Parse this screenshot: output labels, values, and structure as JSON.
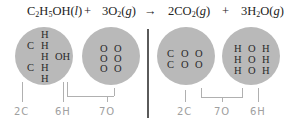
{
  "equation": {
    "reactant1": {
      "prefix": "C",
      "s1": "2",
      "mid": "H",
      "s2": "5",
      "suffix": "OH(",
      "state": "l",
      "close": ")"
    },
    "plus1": "+",
    "reactant2": {
      "coef": "3O",
      "s": "2",
      "open": "(",
      "state": "g",
      "close": ")"
    },
    "arrow": "→",
    "product1": {
      "coef": "2CO",
      "s": "2",
      "open": "(",
      "state": "g",
      "close": ")"
    },
    "plus2": "+",
    "product2": {
      "coef": "3H",
      "s": "2",
      "tail": "O(",
      "state": "g",
      "close": ")"
    }
  },
  "circles": {
    "ethanol": {
      "atoms": [
        "H",
        "C",
        "H",
        "H",
        "OH",
        "C",
        "H",
        "H"
      ]
    },
    "oxygen": {
      "atoms": [
        "O",
        "O",
        "O",
        "O",
        "O",
        "O"
      ]
    },
    "co2": {
      "atoms": [
        "C",
        "O",
        "O",
        "C",
        "O",
        "O"
      ]
    },
    "water": {
      "atoms": [
        "H",
        "O",
        "H",
        "H",
        "O",
        "H",
        "H",
        "O",
        "H"
      ]
    }
  },
  "labels": {
    "left": [
      "2C",
      "6H",
      "7O"
    ],
    "right": [
      "2C",
      "7O",
      "6H"
    ]
  },
  "colors": {
    "circle": "#b9b9b9",
    "divider": "#5a5a5a",
    "label": "#a0a0a0",
    "bracket": "#b0b0b0"
  }
}
